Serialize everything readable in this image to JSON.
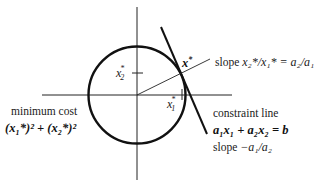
{
  "diagram": {
    "title": "",
    "axes": {
      "origin": [
        137,
        95
      ],
      "horizontal": {
        "x1": 42,
        "x2": 232
      },
      "vertical": {
        "y1": 7,
        "y2": 180
      }
    },
    "circle": {
      "cx": 137,
      "cy": 95,
      "r": 48.5
    },
    "constraint_line": {
      "x1": 161,
      "y1": 27,
      "x2": 207,
      "y2": 134
    },
    "slope_line": {
      "x1": 137,
      "y1": 95,
      "x2": 210,
      "y2": 59
    },
    "optimal_point": {
      "x": 180,
      "y": 74
    },
    "ticks": {
      "x1_star": {
        "x": 182,
        "y": 95
      },
      "x2_star": {
        "x": 137,
        "y": 73
      }
    },
    "labels": {
      "x2_star": {
        "base": "x",
        "sub": "2",
        "sup": "*"
      },
      "x1_star": {
        "base": "x",
        "sub": "1",
        "sup": "*"
      },
      "x_star": {
        "base": "x",
        "sup": "*"
      },
      "slope_ratio": {
        "prefix": "slope",
        "expr": "x₂*/x₁* = a₂/a₁"
      },
      "minimum_cost": {
        "line1": "minimum cost",
        "line2": "(x₁*)² + (x₂*)²"
      },
      "constraint": {
        "line1": "constraint line",
        "line2": "a₁x₁ + a₂x₂ = b",
        "line3_prefix": "slope",
        "line3_expr": "−a₁/a₂"
      }
    },
    "colors": {
      "stroke": "#111111",
      "thin_stroke": "#222222",
      "background": "#ffffff"
    }
  }
}
